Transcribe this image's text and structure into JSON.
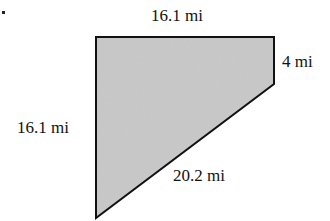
{
  "diagram": {
    "shape": "trapezoid (right trapezoid with slanted bottom side)",
    "fill_color": "#c4c4c4",
    "stroke_color": "#111111",
    "sides": {
      "top": "16.1 mi",
      "right": "4 mi",
      "left": "16.1 mi",
      "slant": "20.2 mi"
    }
  }
}
